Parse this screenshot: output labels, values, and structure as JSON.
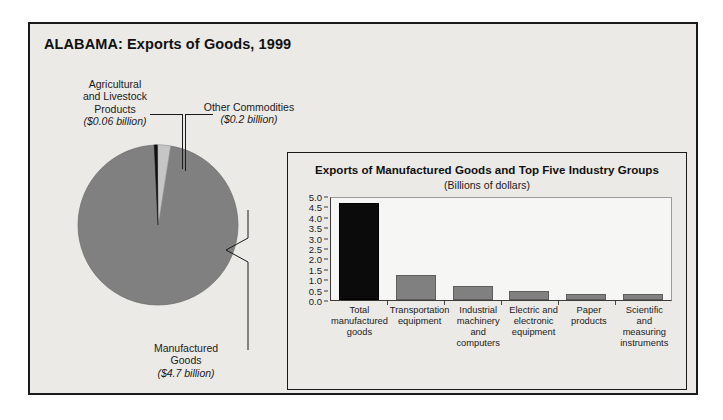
{
  "figure": {
    "title": "ALABAMA: Exports of Goods, 1999",
    "background_color": "#eceae7",
    "border_color": "#1a1a1a"
  },
  "pie": {
    "slices": [
      {
        "name": "manufactured-goods",
        "label_line1": "Manufactured",
        "label_line2": "Goods",
        "amount": "($4.7 billion)",
        "value": 4.7,
        "color": "#808080"
      },
      {
        "name": "agricultural-and-livestock-products",
        "label_line1": "Agricultural",
        "label_line2": "and Livestock",
        "label_line3": "Products",
        "amount": "($0.06 billion)",
        "value": 0.06,
        "color": "#111111"
      },
      {
        "name": "other-commodities",
        "label_line1": "Other Commodities",
        "amount": "($0.2 billion)",
        "value": 0.2,
        "color": "#c6c6c6"
      }
    ]
  },
  "inset": {
    "title": "Exports of Manufactured Goods and Top Five Industry Groups",
    "subtitle": "(Billions of dollars)"
  },
  "chart_data": {
    "type": "bar",
    "title": "Exports of Manufactured Goods and Top Five Industry Groups",
    "subtitle": "(Billions of dollars)",
    "xlabel": "",
    "ylabel": "Billions of dollars",
    "ylim": [
      0.0,
      5.0
    ],
    "yticks": [
      "0.0",
      "0.5",
      "1.0",
      "1.5",
      "2.0",
      "2.5",
      "3.0",
      "3.5",
      "4.0",
      "4.5",
      "5.0"
    ],
    "grid": false,
    "legend": "none",
    "categories": [
      "Total manufactured goods",
      "Transportation equipment",
      "Industrial machinery and computers",
      "Electric and electronic equipment",
      "Paper products",
      "Scientific and measuring instruments"
    ],
    "category_lines": [
      [
        "Total",
        "manufactured",
        "goods"
      ],
      [
        "Transportation",
        "equipment"
      ],
      [
        "Industrial",
        "machinery and",
        "computers"
      ],
      [
        "Electric and",
        "electronic",
        "equipment"
      ],
      [
        "Paper",
        "products"
      ],
      [
        "Scientific and",
        "measuring",
        "instruments"
      ]
    ],
    "values": [
      4.65,
      1.2,
      0.65,
      0.45,
      0.3,
      0.3
    ],
    "bar_colors": [
      "#0b0b0b",
      "#808080",
      "#808080",
      "#808080",
      "#808080",
      "#808080"
    ]
  }
}
